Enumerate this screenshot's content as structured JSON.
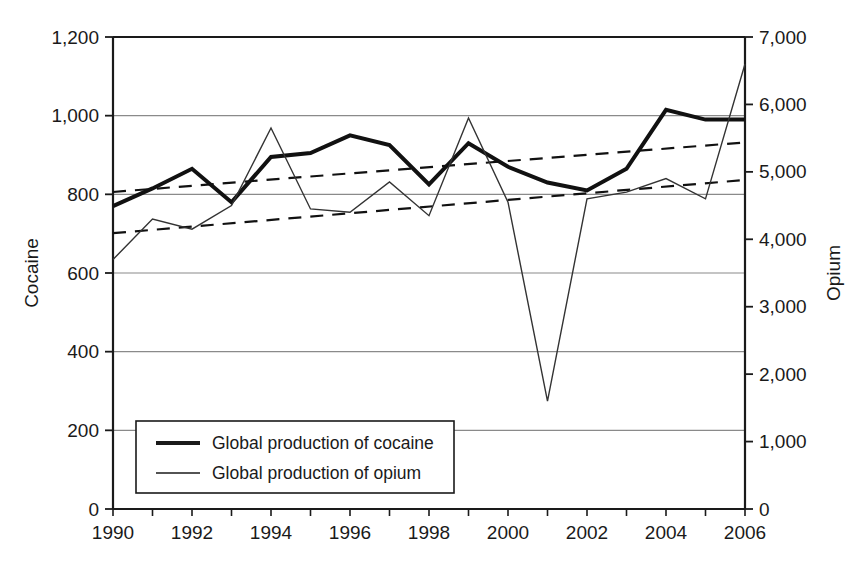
{
  "chart_data": {
    "type": "line",
    "title": "",
    "subtitle": "",
    "x": [
      1990,
      1991,
      1992,
      1993,
      1994,
      1995,
      1996,
      1997,
      1998,
      1999,
      2000,
      2001,
      2002,
      2003,
      2004,
      2005,
      2006
    ],
    "xlabel": "",
    "xtick_labels": [
      "1990",
      "1992",
      "1994",
      "1996",
      "1998",
      "2000",
      "2002",
      "2004",
      "2006"
    ],
    "xtick_values": [
      1990,
      1992,
      1994,
      1996,
      1998,
      2000,
      2002,
      2004,
      2006
    ],
    "xlim": [
      1990,
      2006
    ],
    "grid": true,
    "legend_position": "lower-left-inside",
    "axes": [
      {
        "id": "left",
        "label": "Cocaine",
        "ylim": [
          0,
          1200
        ],
        "ticks": [
          0,
          200,
          400,
          600,
          800,
          1000,
          1200
        ],
        "tick_labels": [
          "0",
          "200",
          "400",
          "600",
          "800",
          "1,000",
          "1,200"
        ]
      },
      {
        "id": "right",
        "label": "Opium",
        "ylim": [
          0,
          7000
        ],
        "ticks": [
          0,
          1000,
          2000,
          3000,
          4000,
          5000,
          6000,
          7000
        ],
        "tick_labels": [
          "0",
          "1,000",
          "2,000",
          "3,000",
          "4,000",
          "5,000",
          "6,000",
          "7,000"
        ]
      }
    ],
    "series": [
      {
        "name": "Global production of cocaine",
        "axis": "left",
        "style": "thick-solid",
        "color": "#111111",
        "width": 4,
        "values": [
          770,
          815,
          865,
          780,
          895,
          905,
          950,
          925,
          825,
          930,
          870,
          830,
          810,
          865,
          1015,
          990,
          990
        ]
      },
      {
        "name": "Global production of opium",
        "axis": "right",
        "style": "thin-solid",
        "color": "#333333",
        "width": 1.4,
        "values": [
          3700,
          4300,
          4150,
          4500,
          5650,
          4450,
          4400,
          4850,
          4350,
          5800,
          4550,
          1600,
          4600,
          4700,
          4900,
          4600,
          6600
        ]
      }
    ],
    "trendlines": [
      {
        "name": "cocaine-trendline",
        "axis": "left",
        "style": "dashed",
        "color": "#111111",
        "start": {
          "x": 1990,
          "y": 806
        },
        "end": {
          "x": 2006,
          "y": 932
        }
      },
      {
        "name": "opium-trendline",
        "axis": "right",
        "style": "dashed",
        "color": "#111111",
        "start": {
          "x": 1990,
          "y": 4090
        },
        "end": {
          "x": 2006,
          "y": 4880
        }
      }
    ],
    "legend": [
      {
        "label": "Global production of cocaine",
        "style": "thick-solid"
      },
      {
        "label": "Global production of opium",
        "style": "thin-solid"
      }
    ]
  },
  "colors": {
    "background": "#ffffff",
    "axis": "#1a1a1a",
    "grid": "#8a8a8a",
    "series_cocaine": "#111111",
    "series_opium": "#333333"
  }
}
